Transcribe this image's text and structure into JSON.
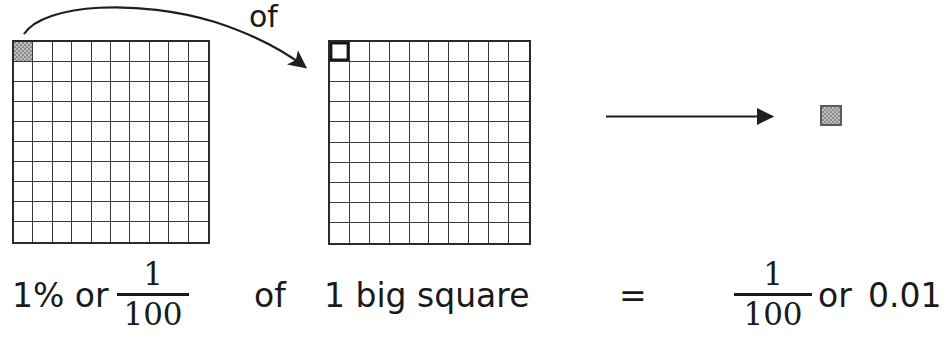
{
  "diagram": {
    "title_implicit": "1% of 1 big square equals 1/100 or 0.01",
    "grids": [
      {
        "name": "hundredths-grid-source",
        "rows": 10,
        "columns": 10,
        "total_cells": 100,
        "highlighted_cells": 1,
        "highlight_position": "top-left",
        "highlight_style": "shaded-gray",
        "shade_color": "#8b8b8b"
      },
      {
        "name": "hundredths-grid-target",
        "rows": 10,
        "columns": 10,
        "total_cells": 100,
        "highlighted_cells": 1,
        "highlight_position": "top-left",
        "highlight_style": "bold-outline",
        "outline_color": "#161616"
      }
    ],
    "result_square": {
      "label": "one-hundredth-square",
      "fill_color": "#8b8b8b",
      "border_color": "#5a5a5a"
    },
    "arrows": [
      {
        "name": "curved-arrow-source-to-target",
        "style": "curved"
      },
      {
        "name": "straight-arrow-to-result",
        "style": "straight"
      }
    ]
  },
  "labels": {
    "of_top": "of",
    "of_bottom": "of",
    "percent_or": "1% or",
    "big_square": "1 big square",
    "equals": "=",
    "or_right": "or",
    "decimal": "0.01"
  },
  "fractions": {
    "left": {
      "numerator": "1",
      "denominator": "100"
    },
    "right": {
      "numerator": "1",
      "denominator": "100"
    }
  },
  "colors": {
    "ink": "#1a1a1a",
    "grid_line": "#3a3a3a",
    "grid_border": "#2b2b2b",
    "shade": "#8b8b8b",
    "background": "#ffffff"
  }
}
